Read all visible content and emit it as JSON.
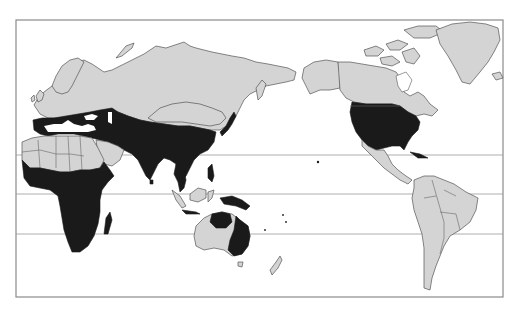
{
  "map": {
    "projection": "pacific-centered world map",
    "colors": {
      "background": "#ffffff",
      "land": "#d4d4d4",
      "highlighted_region": "#1a1a1a",
      "frame": "#8a8a8a",
      "latitude_lines": "#9a9a9a"
    },
    "frame": {
      "x": 16,
      "y": 20,
      "width": 487,
      "height": 277
    },
    "latitude_lines_y": [
      155,
      194,
      234
    ],
    "highlighted_regions": [
      "Mediterranean basin",
      "Middle East and Central Asia southern belt",
      "South and Southeast Asia",
      "Southern China",
      "Japan",
      "Sub-Saharan Africa",
      "Madagascar",
      "New Guinea",
      "Northern and eastern Australia",
      "United States"
    ],
    "unshaded_land": [
      "Northern Europe",
      "Russia / Siberia",
      "Mongolia and Northern China",
      "North Africa (Sahara)",
      "Arabian peninsula",
      "Western and central Australia",
      "Canada and Alaska",
      "Greenland",
      "Mexico and Central America",
      "South America",
      "New Zealand",
      "Indonesia (partially)"
    ]
  }
}
